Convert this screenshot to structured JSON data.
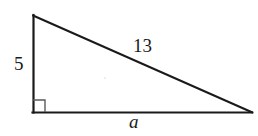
{
  "figure": {
    "name": "right-triangle-diagram",
    "type": "geometry-diagram",
    "background_color": "#ffffff",
    "stroke_color": "#1a1a1a",
    "labels": {
      "vertical_leg": "5",
      "hypotenuse": "13",
      "base_leg": "a"
    },
    "right_angle_marker": {
      "present": true,
      "vertex": "bottom-left",
      "size_px": 12
    },
    "vertices": {
      "top": {
        "x": 33,
        "y": 15
      },
      "bottom_left": {
        "x": 33,
        "y": 112
      },
      "bottom_right": {
        "x": 252,
        "y": 112
      }
    },
    "sides": [
      {
        "name": "vertical-leg",
        "from": "top",
        "to": "bottom_left",
        "label": "5"
      },
      {
        "name": "base-leg",
        "from": "bottom_left",
        "to": "bottom_right",
        "label": "a"
      },
      {
        "name": "hypotenuse",
        "from": "top",
        "to": "bottom_right",
        "label": "13"
      }
    ]
  }
}
